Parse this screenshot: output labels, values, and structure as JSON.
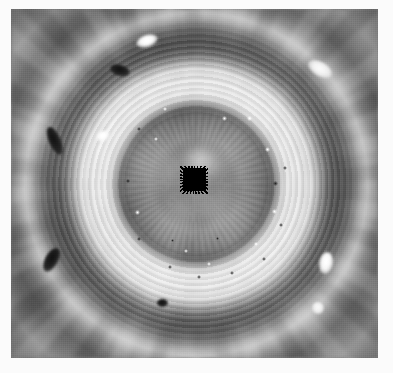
{
  "page": {
    "background_color": "#ffffff",
    "width": 393,
    "height": 373
  },
  "image": {
    "name": "polar-vortex-grayscale-image",
    "alt_text": "Grayscale polar projection of a planetary polar vortex showing concentric cloud bands",
    "colorspace": "grayscale",
    "frame": {
      "left": 11,
      "top": 9,
      "width": 367,
      "height": 349
    },
    "center": {
      "x": 196,
      "y": 184
    }
  },
  "chart_data": {
    "type": "heatmap",
    "title": "",
    "xlabel": "",
    "ylabel": "",
    "x": [
      0,
      10,
      20,
      30,
      40,
      50,
      60,
      70,
      80,
      90,
      100,
      110,
      120,
      130,
      140,
      150,
      160,
      170,
      180
    ],
    "values": [
      140,
      140,
      138,
      143,
      141,
      150,
      138,
      120,
      108,
      140,
      232,
      239,
      232,
      178,
      139,
      92,
      90,
      125,
      180
    ],
    "xlim": [
      0,
      180
    ],
    "ylim": [
      0,
      255
    ],
    "grid": false,
    "legend": "none",
    "annotations": [
      "inner mottled eye core (radius 0-95 px)",
      "dark rim ring (radius 95-105 px)",
      "bright white ring (radius 105-140 px)",
      "dark band (radius 145-170 px)",
      "outer turbulent filament bands (radius 170+ px)"
    ]
  },
  "rings": [
    {
      "name": "eye-core",
      "inner_radius": 0,
      "outer_radius": 95,
      "tone": "#8d8d8d",
      "label": "mottled gray eye core"
    },
    {
      "name": "core-rim",
      "inner_radius": 95,
      "outer_radius": 106,
      "tone": "#6a6a6a",
      "label": "dark rim"
    },
    {
      "name": "bright-ring",
      "inner_radius": 106,
      "outer_radius": 142,
      "tone": "#eeeeee",
      "label": "bright white ring"
    },
    {
      "name": "dark-band",
      "inner_radius": 145,
      "outer_radius": 172,
      "tone": "#5a5a5a",
      "label": "dark band"
    },
    {
      "name": "outer-bands",
      "inner_radius": 172,
      "outer_radius": 250,
      "tone": "#909090",
      "label": "turbulent filamentary bands"
    }
  ],
  "center_mask": {
    "name": "central-data-dropout-mask",
    "color": "#000000",
    "left": 172,
    "top": 159,
    "width": 23,
    "height": 23,
    "label": "black square data dropout at the pole"
  },
  "features": [
    {
      "name": "dark-oval-left-upper",
      "type": "dark-oval",
      "left": 38,
      "top": 117,
      "width": 12,
      "height": 30,
      "rotate": -24
    },
    {
      "name": "dark-oval-left-lower",
      "type": "dark-oval",
      "left": 34,
      "top": 238,
      "width": 13,
      "height": 26,
      "rotate": 28
    },
    {
      "name": "dark-oval-top",
      "type": "dark-oval",
      "left": 99,
      "top": 56,
      "width": 20,
      "height": 11,
      "rotate": 16
    },
    {
      "name": "dark-oval-bottom",
      "type": "dark-oval",
      "left": 146,
      "top": 290,
      "width": 11,
      "height": 8,
      "rotate": 0
    },
    {
      "name": "bright-plume-top",
      "type": "bright-oval",
      "left": 125,
      "top": 26,
      "width": 22,
      "height": 12,
      "rotate": -18
    },
    {
      "name": "bright-plume-top-left",
      "type": "bright-oval",
      "left": 85,
      "top": 122,
      "width": 14,
      "height": 10,
      "rotate": -30
    },
    {
      "name": "bright-plume-right",
      "type": "bright-oval",
      "left": 296,
      "top": 53,
      "width": 26,
      "height": 14,
      "rotate": 30
    },
    {
      "name": "bright-plume-lower-right",
      "type": "bright-oval",
      "left": 308,
      "top": 243,
      "width": 14,
      "height": 22,
      "rotate": 10
    },
    {
      "name": "bright-plume-bottom-right",
      "type": "bright-oval",
      "left": 301,
      "top": 293,
      "width": 12,
      "height": 12,
      "rotate": 0
    }
  ],
  "core_spots": {
    "bright": [
      {
        "left": 211,
        "top": 107,
        "size": 5
      },
      {
        "left": 236,
        "top": 107,
        "size": 5
      },
      {
        "left": 254,
        "top": 138,
        "size": 5
      },
      {
        "left": 261,
        "top": 200,
        "size": 5
      },
      {
        "left": 243,
        "top": 233,
        "size": 4
      },
      {
        "left": 143,
        "top": 128,
        "size": 4
      },
      {
        "left": 124,
        "top": 201,
        "size": 5
      },
      {
        "left": 152,
        "top": 98,
        "size": 4
      },
      {
        "left": 173,
        "top": 240,
        "size": 4
      },
      {
        "left": 196,
        "top": 253,
        "size": 4
      }
    ],
    "dark": [
      {
        "left": 262,
        "top": 172,
        "size": 5
      },
      {
        "left": 272,
        "top": 157,
        "size": 4
      },
      {
        "left": 268,
        "top": 214,
        "size": 4
      },
      {
        "left": 251,
        "top": 248,
        "size": 4
      },
      {
        "left": 219,
        "top": 262,
        "size": 4
      },
      {
        "left": 186,
        "top": 266,
        "size": 4
      },
      {
        "left": 157,
        "top": 256,
        "size": 4
      },
      {
        "left": 126,
        "top": 228,
        "size": 4
      },
      {
        "left": 115,
        "top": 170,
        "size": 4
      },
      {
        "left": 126,
        "top": 118,
        "size": 4
      },
      {
        "left": 160,
        "top": 230,
        "size": 3
      },
      {
        "left": 205,
        "top": 228,
        "size": 3
      }
    ]
  }
}
